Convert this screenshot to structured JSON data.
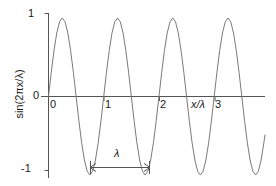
{
  "figure": {
    "title": "",
    "background_color": "#ffffff",
    "curve_color": "#7a7a7a",
    "axis_color": "#555555",
    "text_color": "#1a1a1a"
  },
  "axes": {
    "y_label": "sin(2πx/λ)",
    "y_ticks": [
      "1",
      "0",
      "-1"
    ],
    "x_label": "x/λ",
    "x_ticks": [
      "0",
      "1",
      "2",
      "3"
    ]
  },
  "annotation": {
    "wavelength_label": "λ",
    "arrow_name": "wavelength-double-arrow"
  },
  "chart_data": {
    "type": "line",
    "title": "",
    "xlabel": "x/λ",
    "ylabel": "sin(2πx/λ)",
    "xlim": [
      0,
      3.92
    ],
    "ylim": [
      -1,
      1
    ],
    "xticks": [
      0,
      1,
      2,
      3
    ],
    "yticks": [
      -1,
      0,
      1
    ],
    "grid": false,
    "legend": null,
    "function": "y = sin(2*pi*x)",
    "period": 1,
    "amplitude": 1,
    "n_cycles": 3.92,
    "annotations": [
      {
        "text": "λ",
        "type": "double-headed-arrow",
        "x_start": 0.75,
        "x_end": 1.75,
        "y": -1,
        "meaning": "one wavelength measured trough to trough"
      }
    ],
    "x": [
      0,
      0.05,
      0.1,
      0.15,
      0.2,
      0.25,
      0.3,
      0.35,
      0.4,
      0.45,
      0.5,
      0.55,
      0.6,
      0.65,
      0.7,
      0.75,
      0.8,
      0.85,
      0.9,
      0.95,
      1.0,
      1.05,
      1.1,
      1.15,
      1.2,
      1.25,
      1.3,
      1.35,
      1.4,
      1.45,
      1.5,
      1.55,
      1.6,
      1.65,
      1.7,
      1.75,
      1.8,
      1.85,
      1.9,
      1.95,
      2.0,
      2.05,
      2.1,
      2.15,
      2.2,
      2.25,
      2.3,
      2.35,
      2.4,
      2.45,
      2.5,
      2.55,
      2.6,
      2.65,
      2.7,
      2.75,
      2.8,
      2.85,
      2.9,
      2.95,
      3.0,
      3.05,
      3.1,
      3.15,
      3.2,
      3.25,
      3.3,
      3.35,
      3.4,
      3.45,
      3.5,
      3.55,
      3.6,
      3.65,
      3.7,
      3.75,
      3.8,
      3.85,
      3.9,
      3.92
    ],
    "y": [
      0,
      0.309,
      0.588,
      0.809,
      0.951,
      1.0,
      0.951,
      0.809,
      0.588,
      0.309,
      0,
      -0.309,
      -0.588,
      -0.809,
      -0.951,
      -1.0,
      -0.951,
      -0.809,
      -0.588,
      -0.309,
      0,
      0.309,
      0.588,
      0.809,
      0.951,
      1.0,
      0.951,
      0.809,
      0.588,
      0.309,
      0,
      -0.309,
      -0.588,
      -0.809,
      -0.951,
      -1.0,
      -0.951,
      -0.809,
      -0.588,
      -0.309,
      0,
      0.309,
      0.588,
      0.809,
      0.951,
      1.0,
      0.951,
      0.809,
      0.588,
      0.309,
      0,
      -0.309,
      -0.588,
      -0.809,
      -0.951,
      -1.0,
      -0.951,
      -0.809,
      -0.588,
      -0.309,
      0,
      0.309,
      0.588,
      0.809,
      0.951,
      1.0,
      0.951,
      0.809,
      0.588,
      0.309,
      0,
      -0.309,
      -0.588,
      -0.809,
      -0.951,
      -1.0,
      -0.951,
      -0.809,
      -0.588,
      -0.486
    ]
  }
}
